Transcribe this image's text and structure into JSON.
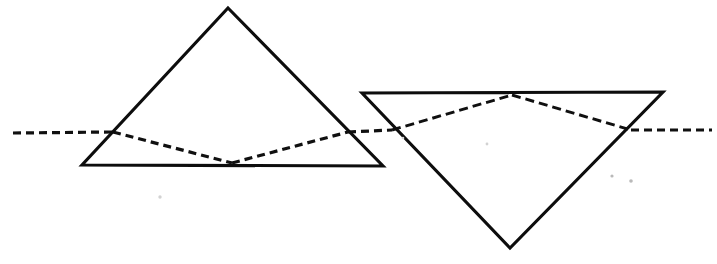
{
  "figure": {
    "title": "Ray path through two prisms",
    "width": 717,
    "height": 264,
    "background_color": "#ffffff",
    "ink_color": "#0d0d0d",
    "style": "hand-drawn line art, scanned"
  },
  "shapes": {
    "left_prism": {
      "name": "upright-triangle-prism",
      "orientation": "apex-up",
      "points": "228,8 383,166 82,165",
      "vertices": [
        {
          "label": "apex",
          "x": 228,
          "y": 8
        },
        {
          "label": "base-right",
          "x": 383,
          "y": 166
        },
        {
          "label": "base-left",
          "x": 82,
          "y": 165
        }
      ],
      "stroke_color": "#0d0d0d",
      "stroke_width": 3.1,
      "fill": "none"
    },
    "right_prism": {
      "name": "inverted-triangle-prism",
      "orientation": "apex-down",
      "points": "362,93 663,92 510,248",
      "vertices": [
        {
          "label": "top-left",
          "x": 362,
          "y": 93
        },
        {
          "label": "top-right",
          "x": 663,
          "y": 92
        },
        {
          "label": "apex-bottom",
          "x": 510,
          "y": 248
        }
      ],
      "stroke_color": "#0d0d0d",
      "stroke_width": 3.1,
      "fill": "none"
    }
  },
  "rays": {
    "style": "dashed",
    "dash_pattern": "8 5",
    "stroke_color": "#101010",
    "stroke_width": 3.2,
    "segments": [
      {
        "name": "incident-ray-left",
        "description": "horizontal incoming dashed ray from left edge to left face of upright prism",
        "points": "13,133 113,132"
      },
      {
        "name": "refracted-ray-down",
        "description": "ray inside upright prism sloping down to the base",
        "points": "113,132 232,163"
      },
      {
        "name": "reflected-ray-up",
        "description": "ray inside upright prism sloping up from base to right face",
        "points": "232,163 348,132"
      },
      {
        "name": "transfer-ray",
        "description": "horizontal ray between the two prisms",
        "points": "348,132 392,130"
      },
      {
        "name": "right-prism-entry-up",
        "description": "ray inside inverted prism sloping up to the top edge",
        "points": "392,130 512,95"
      },
      {
        "name": "right-prism-exit-down",
        "description": "ray inside inverted prism sloping down from the top edge to the right face",
        "points": "512,95 631,130"
      },
      {
        "name": "emergent-ray-right",
        "description": "horizontal outgoing dashed ray to the right edge",
        "points": "631,130 712,130"
      }
    ]
  },
  "specks": [
    {
      "name": "speck-lower-left",
      "x": 160,
      "y": 197,
      "r": 1.7,
      "tone": "faint"
    },
    {
      "name": "speck-lower-right-a",
      "x": 612,
      "y": 176,
      "r": 1.6,
      "tone": "faint"
    },
    {
      "name": "speck-lower-right-b",
      "x": 631,
      "y": 181,
      "r": 1.8,
      "tone": "faint"
    },
    {
      "name": "speck-mid-right",
      "x": 487,
      "y": 144,
      "r": 1.4,
      "tone": "very-faint"
    },
    {
      "name": "speck-left-inner",
      "x": 403,
      "y": 138,
      "r": 1.3,
      "tone": "very-faint"
    }
  ]
}
